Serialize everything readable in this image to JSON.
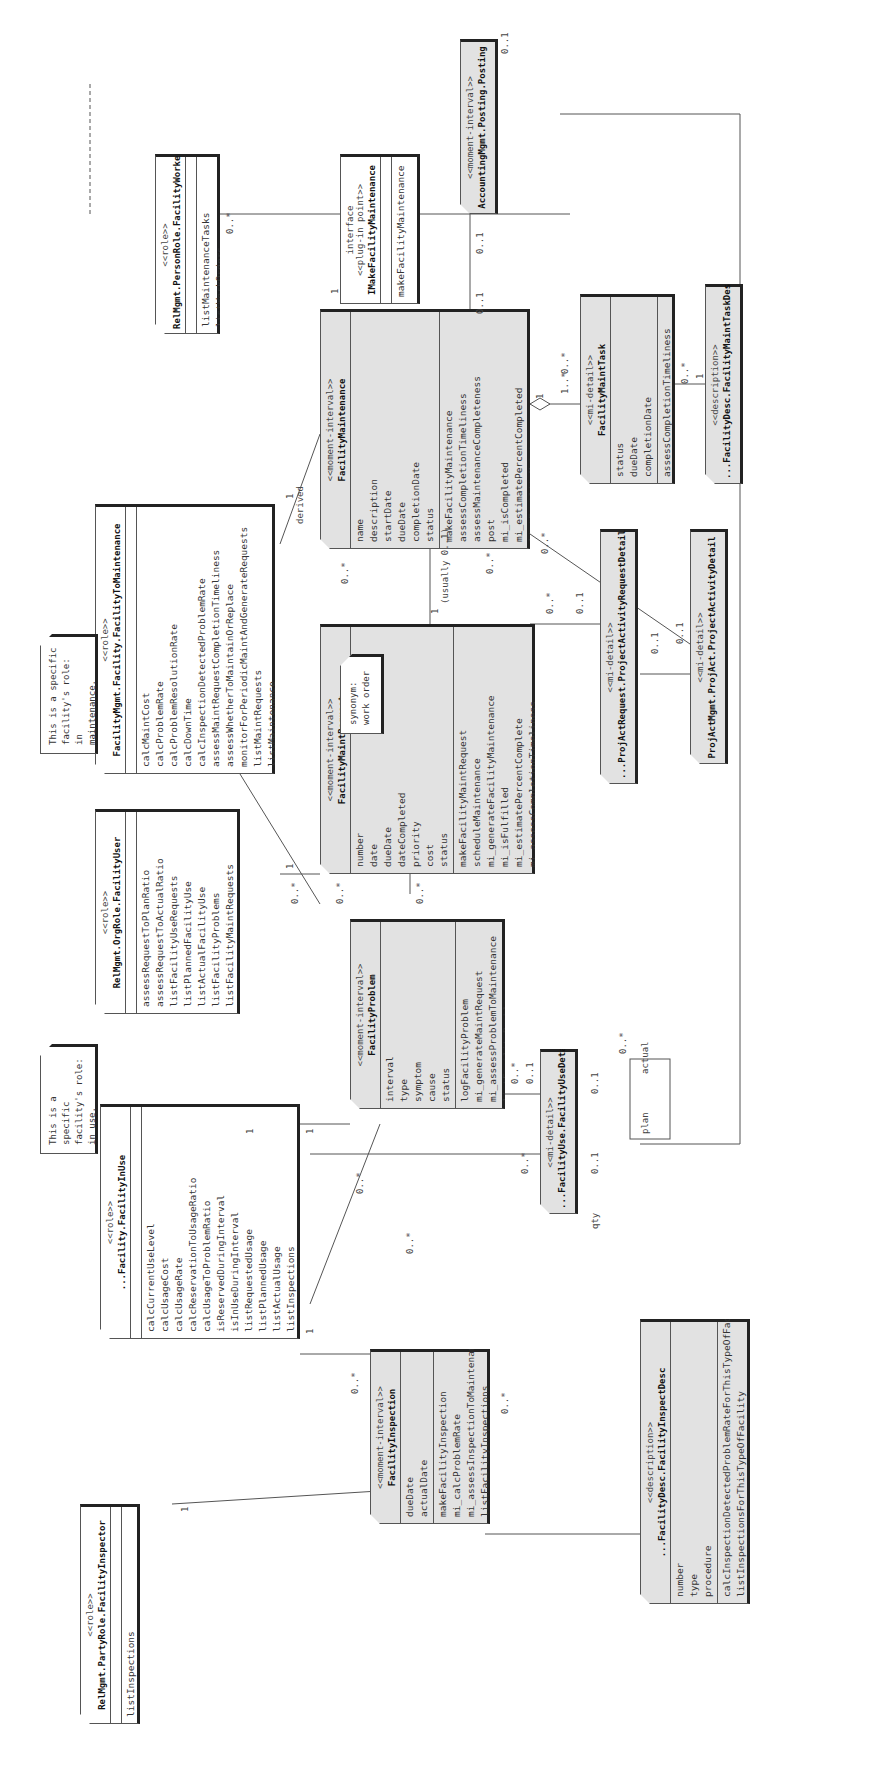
{
  "diagram": {
    "classes": {
      "facility_inspector": {
        "stereotype": "<<role>>",
        "name": "RelMgmt.PartyRole.FacilityInspector",
        "attributes": [],
        "methods": [
          "listInspections"
        ]
      },
      "facility_in_use": {
        "stereotype": "<<role>>",
        "name": "...Facility.FacilityInUse",
        "attributes": [],
        "methods": [
          "calcCurrentUseLevel",
          "calcUsageCost",
          "calcUsageRate",
          "calcReservationToUsageRatio",
          "calcUsageToProblemRatio",
          "isReservedDuringInterval",
          "isInUseDuringInterval",
          "listRequestedUsage",
          "listPlannedUsage",
          "listActualUsage",
          "listInspections",
          "listProblems"
        ]
      },
      "facility_user": {
        "stereotype": "<<role>>",
        "name": "RelMgmt.OrgRole.FacilityUser",
        "attributes": [],
        "methods": [
          "assessRequestToPlanRatio",
          "assessRequestToActualRatio",
          "listFacilityUseRequests",
          "listPlannedFacilityUse",
          "listActualFacilityUse",
          "listFacilityProblems",
          "listFacilityMaintRequests"
        ]
      },
      "facility_to_maintenance": {
        "stereotype": "<<role>>",
        "name": "FacilityMgmt.Facility.FacilityToMaintenance",
        "attributes": [],
        "methods": [
          "calcMaintCost",
          "calcProblemRate",
          "calcProblemResolutionRate",
          "calcDownTime",
          "calcInspectionDetectedProblemRate",
          "assessMaintRequestCompletionTimeliness",
          "assessWhetherToMaintainOrReplace",
          "monitorForPeriodicMaintAndGenerateRequests",
          "listMaintRequests",
          "listMaintenance"
        ]
      },
      "facility_worker": {
        "stereotype": "<<role>>",
        "name": "RelMgmt.PersonRole.FacilityWorker",
        "attributes": [],
        "methods": [
          "listMaintenanceTasks",
          "listWorkOrders"
        ]
      },
      "imake_facility_maintenance": {
        "stereotype": "interface\n<<plug-in point>>",
        "name": "IMakeFacilityMaintenance",
        "attributes": [],
        "methods": [
          "makeFacilityMaintenance"
        ]
      },
      "accounting_posting": {
        "stereotype": "<<moment-interval>>",
        "name": "AccountingMgmt.Posting.Posting"
      },
      "facility_inspection": {
        "stereotype": "<<moment-interval>>",
        "name": "FacilityInspection",
        "attributes": [
          "dueDate",
          "actualDate"
        ],
        "methods": [
          "makeFacilityInspection",
          "mi_calcProblemRate",
          "mi_assessInspectionToMaintenance",
          "listFacilityInspections"
        ]
      },
      "facility_problem": {
        "stereotype": "<<moment-interval>>",
        "name": "FacilityProblem",
        "attributes": [
          "interval",
          "type",
          "symptom",
          "cause",
          "status"
        ],
        "methods": [
          "logFacilityProblem",
          "mi_generateMaintRequest",
          "mi_assessProblemToMaintenance",
          "listFacilityProblems"
        ]
      },
      "facility_maint_request": {
        "stereotype": "<<moment-interval>>",
        "name": "FacilityMaintRequest",
        "attributes": [
          "number",
          "date",
          "dueDate",
          "dateCompleted",
          "priority",
          "cost",
          "status"
        ],
        "methods": [
          "makeFacilityMaintRequest",
          "scheduleMaintenance",
          "mi_generateFacilityMaintenance",
          "mi_isFulfilled",
          "mi_estimatePercentComplete",
          "mi_assessCompletionTimeliness",
          "mi_assessMaintRequestToMaintenance",
          "listFacilityWorkOrders"
        ]
      },
      "facility_maintenance": {
        "stereotype": "<<moment-interval>>",
        "name": "FacilityMaintenance",
        "attributes": [
          "name",
          "description",
          "startDate",
          "dueDate",
          "completionDate",
          "status"
        ],
        "methods": [
          "makeFacilityMaintenance",
          "assessCompletionTimeliness",
          "assessMaintenanceCompleteness",
          "post",
          "mi_isCompleted",
          "mi_estimatePercentCompleted",
          "listFacilityMaintenances"
        ]
      },
      "facility_maint_task": {
        "stereotype": "<<mi-detail>>",
        "name": "FacilityMaintTask",
        "attributes": [
          "status",
          "dueDate",
          "completionDate"
        ],
        "methods": [
          "assessCompletionTimeliness"
        ]
      },
      "facility_maint_task_desc": {
        "stereotype": "<<description>>",
        "name": "...FacilityDesc.FacilityMaintTaskDesc"
      },
      "facility_use_detail": {
        "stereotype": "<<mi-detail>>",
        "name": "...FacilityUse.FacilityUseDetail"
      },
      "project_activity_request_detail": {
        "stereotype": "<<mi-detail>>",
        "name": "...ProjActRequest.ProjectActivityRequestDetail"
      },
      "project_activity_detail": {
        "stereotype": "<<mi-detail>>",
        "name": "ProjActMgmt.ProjAct.ProjectActivityDetail"
      },
      "facility_inspect_desc": {
        "stereotype": "<<description>>",
        "name": "...FacilityDesc.FacilityInspectDesc",
        "attributes": [
          "number",
          "type",
          "procedure"
        ],
        "methods": [
          "calcInspectionDetectedProblemRateForThisTypeOfFacility",
          "listInspectionsForThisTypeOfFacility"
        ]
      }
    },
    "notes": {
      "in_use_note": "This is a specific\nfacility's role:\nin use.",
      "maintenance_note": "This is a specific\nfacility's role: in\nmaintenance.",
      "work_order_note": "synonym:\n  work order"
    },
    "labels": {
      "one": "1",
      "zero_many": "0..*",
      "zero_one": "0..1",
      "one_many": "1..*",
      "derived": "derived",
      "usually": "(usually 0..1)",
      "actual": "actual",
      "plan": "plan",
      "qty": "qty"
    }
  }
}
